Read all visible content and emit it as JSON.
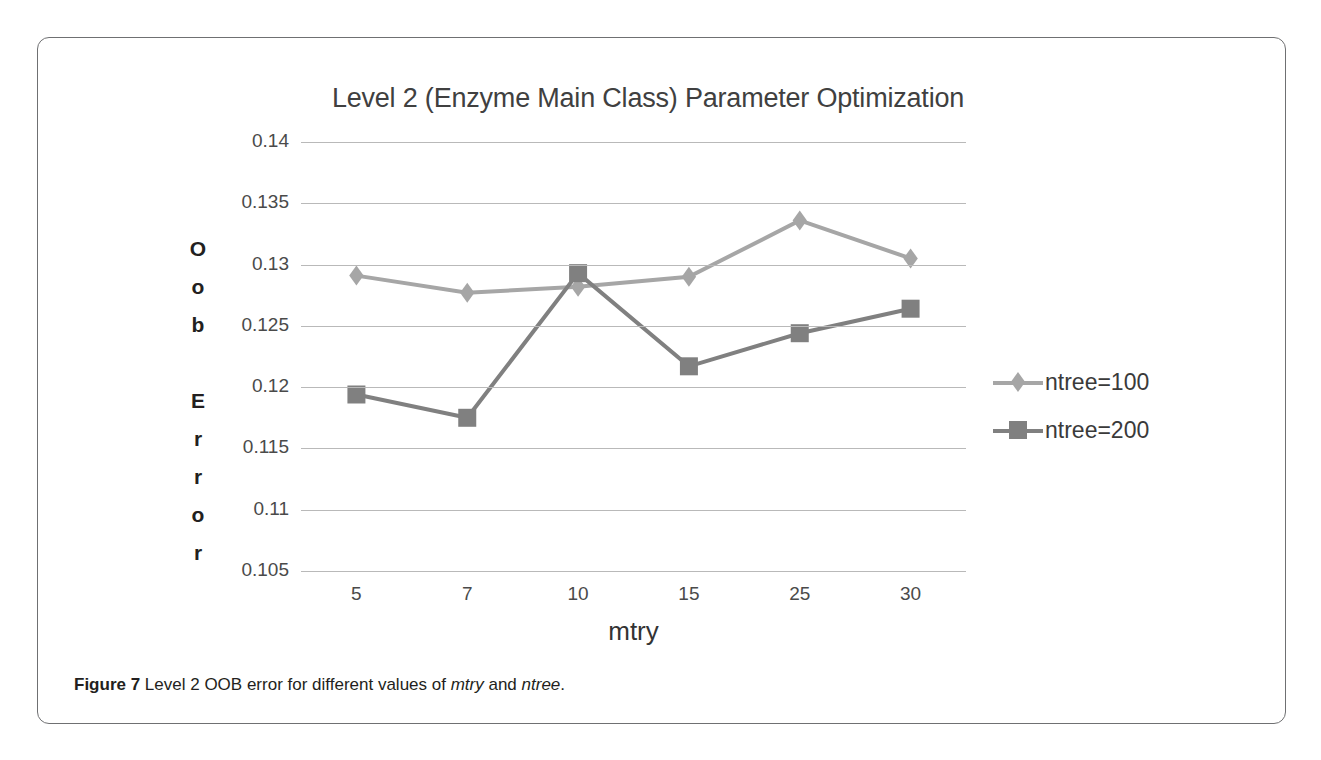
{
  "figure": {
    "caption_label": "Figure 7",
    "caption_text": " Level 2 OOB error for different values of ",
    "caption_italic_1": "mtry",
    "caption_mid": " and ",
    "caption_italic_2": "ntree",
    "caption_end": "."
  },
  "chart_data": {
    "type": "line",
    "title": "Level 2 (Enzyme Main Class) Parameter Optimization",
    "xlabel": "mtry",
    "ylabel": "Oob Error",
    "ylabel_chars": [
      "O",
      "o",
      "b",
      " ",
      "E",
      "r",
      "r",
      "o",
      "r"
    ],
    "categories": [
      "5",
      "7",
      "10",
      "15",
      "25",
      "30"
    ],
    "yticks": [
      "0.105",
      "0.11",
      "0.115",
      "0.12",
      "0.125",
      "0.13",
      "0.135",
      "0.14"
    ],
    "ylim": [
      0.105,
      0.14
    ],
    "grid": true,
    "legend_position": "right",
    "series": [
      {
        "name": "ntree=100",
        "marker": "diamond",
        "color": "#a6a6a6",
        "values": [
          0.1291,
          0.1277,
          0.1282,
          0.129,
          0.1336,
          0.1305
        ]
      },
      {
        "name": "ntree=200",
        "marker": "square",
        "color": "#808080",
        "values": [
          0.1194,
          0.1175,
          0.1293,
          0.1217,
          0.1244,
          0.1264
        ]
      }
    ]
  }
}
